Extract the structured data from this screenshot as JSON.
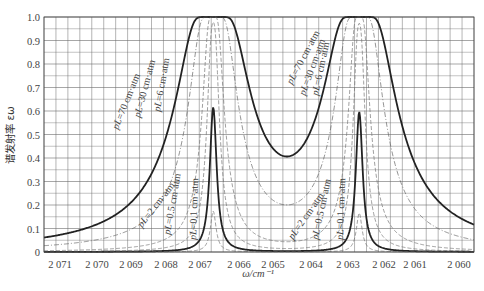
{
  "chart_data": {
    "type": "line",
    "title": "",
    "xlabel": "ω/cm⁻¹",
    "ylabel": "谱发射率 εω",
    "xlim": [
      2071.44,
      2059.6
    ],
    "ylim": [
      0,
      1.0
    ],
    "x_reversed": true,
    "grid": true,
    "x_ticks": [
      2071,
      2070,
      2069,
      2068,
      2067,
      2066,
      2065,
      2064,
      2063,
      2062,
      2061,
      2060
    ],
    "x_tick_labels": [
      "2 071",
      "2 070",
      "2 069",
      "2 068",
      "2 067",
      "2 066",
      "2 065",
      "2 064",
      "2 063",
      "2 062",
      "2 061",
      "2 060"
    ],
    "y_ticks": [
      0,
      0.1,
      0.2,
      0.3,
      0.4,
      0.5,
      0.6,
      0.7,
      0.8,
      0.9,
      1.0
    ],
    "y_tick_labels": [
      "0",
      "0.1",
      "0.2",
      "0.3",
      "0.4",
      "0.5",
      "0.6",
      "0.7",
      "0.8",
      "0.9",
      "1.0"
    ],
    "line_centers_cm-1": [
      2066.78,
      2062.76
    ],
    "legend": [],
    "series": [
      {
        "name": "pL=70 cm·atm",
        "style": "thick-solid",
        "pL": 70,
        "x": [
          2071.44,
          2070,
          2069,
          2068.5,
          2068,
          2067.5,
          2067,
          2066.5,
          2066,
          2065.5,
          2064.77,
          2064,
          2063.5,
          2063,
          2062.5,
          2062,
          2061.5,
          2061,
          2060.5,
          2060,
          2059.6
        ],
        "values": [
          0.19,
          0.31,
          0.62,
          0.88,
          0.99,
          1.0,
          1.0,
          1.0,
          0.95,
          0.79,
          0.66,
          0.8,
          0.97,
          1.0,
          1.0,
          0.99,
          0.88,
          0.62,
          0.45,
          0.33,
          0.27
        ]
      },
      {
        "name": "pL=30 cm·atm",
        "style": "thin-dashdot",
        "pL": 30,
        "x": [
          2071.44,
          2070,
          2069,
          2068.5,
          2068,
          2067.5,
          2067,
          2066.5,
          2066,
          2065.5,
          2064.77,
          2064,
          2063.5,
          2063,
          2062.5,
          2062,
          2061.5,
          2061,
          2060.5,
          2060,
          2059.6
        ],
        "values": [
          0.08,
          0.15,
          0.35,
          0.62,
          0.91,
          1.0,
          1.0,
          0.98,
          0.73,
          0.5,
          0.37,
          0.52,
          0.8,
          1.0,
          1.0,
          0.9,
          0.62,
          0.35,
          0.22,
          0.15,
          0.12
        ]
      },
      {
        "name": "pL=6 cm·atm",
        "style": "thin-dashed",
        "pL": 6,
        "x": [
          2071.44,
          2070,
          2069,
          2068.5,
          2068,
          2067.5,
          2067,
          2066.5,
          2066,
          2065.5,
          2064.77,
          2064,
          2063.5,
          2063,
          2062.5,
          2062,
          2061.5,
          2061,
          2060.5,
          2060,
          2059.6
        ],
        "values": [
          0.02,
          0.04,
          0.1,
          0.22,
          0.55,
          0.95,
          1.0,
          0.9,
          0.35,
          0.15,
          0.1,
          0.17,
          0.45,
          0.97,
          1.0,
          0.55,
          0.22,
          0.1,
          0.06,
          0.04,
          0.03
        ]
      },
      {
        "name": "pL=2 cm·atm",
        "style": "thin-dashed",
        "pL": 2,
        "x": [
          2071.44,
          2070,
          2069,
          2068.5,
          2068,
          2067.5,
          2067,
          2066.5,
          2066,
          2065.5,
          2064.77,
          2064,
          2063.5,
          2063,
          2062.5,
          2062,
          2061.5,
          2061,
          2060.5,
          2060,
          2059.6
        ],
        "values": [
          0.03,
          0.05,
          0.1,
          0.18,
          0.42,
          0.85,
          1.0,
          0.7,
          0.22,
          0.1,
          0.06,
          0.1,
          0.3,
          0.9,
          0.95,
          0.35,
          0.14,
          0.07,
          0.05,
          0.04,
          0.03
        ]
      },
      {
        "name": "pL=0.5 cm·atm",
        "style": "thick-solid",
        "pL": 0.5,
        "x": [
          2071.44,
          2070,
          2069,
          2068.5,
          2068,
          2067.5,
          2067,
          2066.5,
          2066,
          2065.5,
          2064.77,
          2064,
          2063.5,
          2063,
          2062.5,
          2062,
          2061.5,
          2061,
          2060.5,
          2060,
          2059.6
        ],
        "values": [
          0.01,
          0.01,
          0.03,
          0.06,
          0.16,
          0.6,
          1.0,
          0.5,
          0.1,
          0.05,
          0.03,
          0.05,
          0.13,
          0.75,
          0.85,
          0.13,
          0.05,
          0.03,
          0.02,
          0.01,
          0.01
        ]
      },
      {
        "name": "pL=0.1 cm·atm",
        "style": "thin-dashed",
        "pL": 0.1,
        "x": [
          2071.44,
          2070,
          2069,
          2068.5,
          2068,
          2067.5,
          2067,
          2066.5,
          2066,
          2065.5,
          2064.77,
          2064,
          2063.5,
          2063,
          2062.5,
          2062,
          2061.5,
          2061,
          2060.5,
          2060,
          2059.6
        ],
        "values": [
          0.0,
          0.0,
          0.01,
          0.02,
          0.04,
          0.2,
          0.95,
          0.15,
          0.03,
          0.01,
          0.01,
          0.01,
          0.04,
          0.3,
          0.35,
          0.04,
          0.01,
          0.0,
          0.0,
          0.0,
          0.0
        ]
      }
    ],
    "annotations": [
      "pL=70 cm·atm",
      "pL=30 cm·atm",
      "pL=6 cm·atm",
      "pL=2 cm·atm",
      "pL=0.5 cm·atm",
      "pL=0.1 cm·atm",
      "pL=70 cm·atm",
      "pL=30 cm·atm",
      "pL=6 cm·atm",
      "pL=2 cm·atm",
      "pL=0.5 cm·atm",
      "pL=0.1 cm·atm"
    ]
  },
  "labels": {
    "y_axis": "谱发射率 εω",
    "x_axis": "ω/cm⁻¹"
  },
  "colors": {
    "grid": "#6b6b6b",
    "curve": "#222222",
    "thin_curve": "#777777",
    "text": "#444444"
  }
}
